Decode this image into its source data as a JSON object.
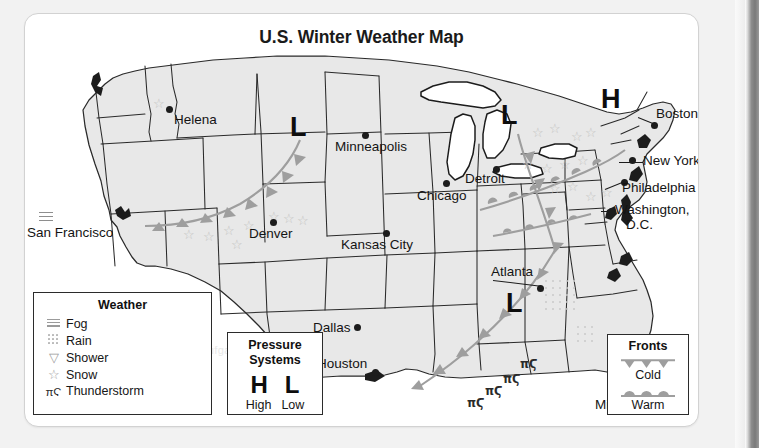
{
  "page": {
    "title": "U.S. Winter Weather Map",
    "background": "#f2f2f2",
    "card_background": "#ffffff",
    "land_fill": "#e8e8e8",
    "front_color": "#9e9e9e",
    "symbol_color": "#c2c2c2"
  },
  "map": {
    "cities": [
      {
        "name": "Helena",
        "label": "Helena",
        "dot": [
          142,
          95
        ],
        "label_pos": [
          148,
          101
        ],
        "anchor": "left"
      },
      {
        "name": "San Francisco",
        "label": "San Francisco",
        "dot": null,
        "label_pos": [
          5,
          215
        ],
        "anchor": "left"
      },
      {
        "name": "Denver",
        "label": "Denver",
        "dot": [
          246,
          207
        ],
        "label_pos": [
          225,
          214
        ],
        "anchor": "left"
      },
      {
        "name": "Minneapolis",
        "label": "Minneapolis",
        "dot": [
          338,
          120
        ],
        "label_pos": [
          311,
          128
        ],
        "anchor": "left"
      },
      {
        "name": "Kansas City",
        "label": "Kansas City",
        "dot": [
          359,
          219
        ],
        "label_pos": [
          317,
          226
        ],
        "anchor": "left"
      },
      {
        "name": "Chicago",
        "label": "Chicago",
        "dot": [
          419,
          168
        ],
        "label_pos": [
          393,
          177
        ],
        "anchor": "left"
      },
      {
        "name": "Detroit",
        "label": "Detroit",
        "dot": [
          463,
          154
        ],
        "label_pos": [
          453,
          162
        ],
        "anchor": "left"
      },
      {
        "name": "Boston",
        "label": "Boston",
        "dot": [
          631,
          110
        ],
        "label_pos": [
          633,
          96
        ],
        "anchor": "left"
      },
      {
        "name": "New York",
        "label": "New York",
        "dot": [
          609,
          146
        ],
        "label_pos": [
          616,
          142
        ],
        "anchor": "left"
      },
      {
        "name": "Philadelphia",
        "label": "Philadelphia",
        "dot": [
          601,
          168
        ],
        "label_pos": [
          597,
          170
        ],
        "anchor": "left"
      },
      {
        "name": "Washington, D.C.",
        "label": "Washington,",
        "label2": "D.C.",
        "dot": [
          585,
          196
        ],
        "label_pos": [
          590,
          194
        ],
        "anchor": "left"
      },
      {
        "name": "Atlanta",
        "label": "Atlanta",
        "dot": [
          513,
          273
        ],
        "label_pos": [
          468,
          258
        ],
        "anchor": "left"
      },
      {
        "name": "Dallas",
        "label": "Dallas",
        "dot": [
          330,
          312
        ],
        "label_pos": [
          293,
          310
        ],
        "anchor": "left"
      },
      {
        "name": "Houston",
        "label": "Houston",
        "dot": [
          350,
          357
        ],
        "label_pos": [
          297,
          346
        ],
        "anchor": "left"
      },
      {
        "name": "Miami",
        "label": "Miami",
        "dot": [
          601,
          392
        ],
        "label_pos": [
          573,
          388
        ],
        "anchor": "left"
      }
    ],
    "pressure_systems": [
      {
        "type": "L",
        "symbol": "L",
        "pos": [
          272,
          112
        ]
      },
      {
        "type": "L",
        "symbol": "L",
        "pos": [
          482,
          100
        ]
      },
      {
        "type": "H",
        "symbol": "H",
        "pos": [
          584,
          84
        ]
      },
      {
        "type": "L",
        "symbol": "L",
        "pos": [
          487,
          288
        ]
      }
    ],
    "fronts": [
      {
        "type": "cold",
        "label": "Cold front - western"
      },
      {
        "type": "cold",
        "label": "Cold front - southeastern"
      },
      {
        "type": "warm",
        "label": "Warm front - mid-atlantic"
      }
    ],
    "weather_marks": [
      {
        "type": "fog",
        "location": "San Francisco"
      },
      {
        "type": "snow",
        "location": "Helena"
      },
      {
        "type": "snow",
        "location": "Colorado / Rockies"
      },
      {
        "type": "snow",
        "location": "Northeast / New England"
      },
      {
        "type": "rain",
        "location": "South Carolina / Georgia"
      },
      {
        "type": "rain",
        "location": "North Florida"
      },
      {
        "type": "thunderstorm",
        "location": "Gulf Coast"
      }
    ]
  },
  "legends": {
    "weather": {
      "title": "Weather",
      "items": [
        {
          "icon": "fog-icon",
          "label": "Fog"
        },
        {
          "icon": "rain-icon",
          "label": "Rain"
        },
        {
          "icon": "shower-icon",
          "label": "Shower",
          "glyph": "▽"
        },
        {
          "icon": "snow-icon",
          "label": "Snow",
          "glyph": "☆"
        },
        {
          "icon": "thunderstorm-icon",
          "label": "Thunderstorm",
          "glyph": "πϚ"
        }
      ]
    },
    "pressure": {
      "title_line1": "Pressure",
      "title_line2": "Systems",
      "high_symbol": "H",
      "low_symbol": "L",
      "high_label": "High",
      "low_label": "Low"
    },
    "fronts": {
      "title": "Fronts",
      "cold_label": "Cold",
      "warm_label": "Warm"
    }
  },
  "ghost_text": {
    "l1": "Kalender der Unterrichtsstunde",
    "l2": "der Unterricht",
    "l3": "Aufgabe und die",
    "l4": "ein Beispiel"
  }
}
